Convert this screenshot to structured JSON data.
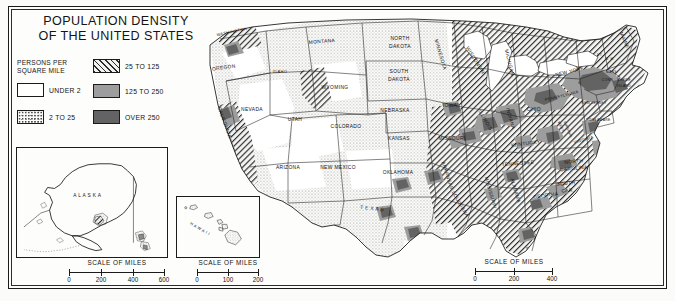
{
  "title": {
    "line1": "POPULATION DENSITY",
    "line2": "OF THE UNITED STATES"
  },
  "legend": {
    "heading_line1": "PERSONS PER",
    "heading_line2": "SQUARE MILE",
    "items": [
      {
        "label": "UNDER 2",
        "pattern": "white",
        "color": "#ffffff"
      },
      {
        "label": "2 TO 25",
        "pattern": "dots",
        "color": "#fdfdfb"
      },
      {
        "label": "25 TO 125",
        "pattern": "hatch",
        "color": "#f2f2f0"
      },
      {
        "label": "125 TO 250",
        "pattern": "solid",
        "color": "#9d9d9d"
      },
      {
        "label": "OVER 250",
        "pattern": "solid",
        "color": "#636363"
      }
    ]
  },
  "scales": {
    "alaska": {
      "title": "SCALE OF MILES",
      "ticks": [
        "0",
        "200",
        "400",
        "600"
      ]
    },
    "hawaii": {
      "title": "SCALE OF MILES",
      "ticks": [
        "0",
        "100",
        "200"
      ]
    },
    "main": {
      "title": "SCALE OF MILES",
      "ticks": [
        "0",
        "200",
        "400"
      ]
    }
  },
  "insets": {
    "alaska": {
      "label": "A L A S K A"
    },
    "hawaii": {
      "label": "H A W A I I"
    }
  },
  "map": {
    "states": [
      {
        "name": "WASHINGTON",
        "x": 36,
        "y": 22,
        "rotate": -12,
        "size": "sm"
      },
      {
        "name": "OREGON",
        "x": 28,
        "y": 58,
        "rotate": -8,
        "size": "md"
      },
      {
        "name": "IDAHO",
        "x": 84,
        "y": 62,
        "rotate": 0,
        "size": "sm"
      },
      {
        "name": "MONTANA",
        "x": 126,
        "y": 32,
        "rotate": -4,
        "size": "md"
      },
      {
        "name": "WYOMING",
        "x": 139,
        "y": 78,
        "rotate": 0,
        "size": "md"
      },
      {
        "name": "NEVADA",
        "x": 56,
        "y": 100,
        "rotate": 0,
        "size": "md"
      },
      {
        "name": "UTAH",
        "x": 99,
        "y": 110,
        "rotate": 0,
        "size": "md"
      },
      {
        "name": "COLORADO",
        "x": 150,
        "y": 117,
        "rotate": 0,
        "size": "md"
      },
      {
        "name": "CALIFORNIA",
        "x": 27,
        "y": 112,
        "rotate": 70,
        "size": "md"
      },
      {
        "name": "ARIZONA",
        "x": 92,
        "y": 158,
        "rotate": 0,
        "size": "md"
      },
      {
        "name": "NEW MEXICO",
        "x": 142,
        "y": 158,
        "rotate": 0,
        "size": "md"
      },
      {
        "name": "NORTH",
        "x": 204,
        "y": 29,
        "rotate": 0,
        "size": "md"
      },
      {
        "name": "DAKOTA",
        "x": 204,
        "y": 37,
        "rotate": 0,
        "size": "md"
      },
      {
        "name": "SOUTH",
        "x": 203,
        "y": 62,
        "rotate": 0,
        "size": "md"
      },
      {
        "name": "DAKOTA",
        "x": 203,
        "y": 70,
        "rotate": 0,
        "size": "md"
      },
      {
        "name": "NEBRASKA",
        "x": 199,
        "y": 101,
        "rotate": 0,
        "size": "md"
      },
      {
        "name": "KANSAS",
        "x": 203,
        "y": 129,
        "rotate": 0,
        "size": "md"
      },
      {
        "name": "OKLAHOMA",
        "x": 202,
        "y": 163,
        "rotate": 0,
        "size": "md"
      },
      {
        "name": "T E X A S",
        "x": 176,
        "y": 199,
        "rotate": 6,
        "size": "md"
      },
      {
        "name": "MINNESOTA",
        "x": 243,
        "y": 44,
        "rotate": 74,
        "size": "md"
      },
      {
        "name": "IOWA",
        "x": 254,
        "y": 96,
        "rotate": 0,
        "size": "md"
      },
      {
        "name": "MISSOURI",
        "x": 256,
        "y": 129,
        "rotate": 0,
        "size": "md"
      },
      {
        "name": "ARKANSAS",
        "x": 250,
        "y": 165,
        "rotate": 72,
        "size": "md"
      },
      {
        "name": "LOUISIANA",
        "x": 263,
        "y": 194,
        "rotate": 60,
        "size": "md"
      },
      {
        "name": "WISCONSIN",
        "x": 278,
        "y": 50,
        "rotate": 58,
        "size": "md"
      },
      {
        "name": "ILLINOIS",
        "x": 288,
        "y": 110,
        "rotate": 60,
        "size": "md"
      },
      {
        "name": "MISSISSIPPI",
        "x": 293,
        "y": 182,
        "rotate": 74,
        "size": "md"
      },
      {
        "name": "MICHIGAN",
        "x": 312,
        "y": 52,
        "rotate": 76,
        "size": "md"
      },
      {
        "name": "INDIANA",
        "x": 313,
        "y": 108,
        "rotate": 74,
        "size": "md"
      },
      {
        "name": "ALABAMA",
        "x": 318,
        "y": 180,
        "rotate": 74,
        "size": "md"
      },
      {
        "name": "OHIO",
        "x": 338,
        "y": 100,
        "rotate": 0,
        "size": "md"
      },
      {
        "name": "KENTUCKY",
        "x": 330,
        "y": 134,
        "rotate": -8,
        "size": "md"
      },
      {
        "name": "TENNESSEE",
        "x": 322,
        "y": 154,
        "rotate": -4,
        "size": "md"
      },
      {
        "name": "GEORGIA",
        "x": 350,
        "y": 186,
        "rotate": -8,
        "size": "md"
      },
      {
        "name": "WEST",
        "x": 364,
        "y": 116,
        "rotate": 66,
        "size": "xs"
      },
      {
        "name": "VIRGINIA",
        "x": 371,
        "y": 119,
        "rotate": 66,
        "size": "xs"
      },
      {
        "name": "VIRGINIA",
        "x": 388,
        "y": 130,
        "rotate": -16,
        "size": "sm"
      },
      {
        "name": "NORTH",
        "x": 378,
        "y": 152,
        "rotate": -6,
        "size": "md"
      },
      {
        "name": "CAROLINA",
        "x": 378,
        "y": 159,
        "rotate": -6,
        "size": "md"
      },
      {
        "name": "SOUTH",
        "x": 370,
        "y": 174,
        "rotate": -4,
        "size": "md"
      },
      {
        "name": "CAR.",
        "x": 372,
        "y": 181,
        "rotate": -4,
        "size": "md"
      },
      {
        "name": "PENNSYLVANIA",
        "x": 366,
        "y": 86,
        "rotate": -14,
        "size": "sm"
      },
      {
        "name": "NEW YORK",
        "x": 374,
        "y": 62,
        "rotate": -14,
        "size": "md"
      },
      {
        "name": "MAINE",
        "x": 427,
        "y": 30,
        "rotate": 66,
        "size": "md"
      },
      {
        "name": "N. H.",
        "x": 414,
        "y": 49,
        "rotate": 0,
        "size": "xs"
      },
      {
        "name": "VT.",
        "x": 404,
        "y": 45,
        "rotate": 0,
        "size": "xs"
      },
      {
        "name": "MASS.",
        "x": 416,
        "y": 62,
        "rotate": 0,
        "size": "xs"
      },
      {
        "name": "CONN.",
        "x": 412,
        "y": 70,
        "rotate": 0,
        "size": "xs"
      },
      {
        "name": "RHODE",
        "x": 428,
        "y": 70,
        "rotate": 0,
        "size": "xs"
      },
      {
        "name": "ISLAND",
        "x": 428,
        "y": 76,
        "rotate": 0,
        "size": "xs"
      },
      {
        "name": "NEW JERSEY",
        "x": 398,
        "y": 93,
        "rotate": 0,
        "size": "xs"
      },
      {
        "name": "DELAWARE",
        "x": 404,
        "y": 110,
        "rotate": 0,
        "size": "xs"
      }
    ]
  }
}
